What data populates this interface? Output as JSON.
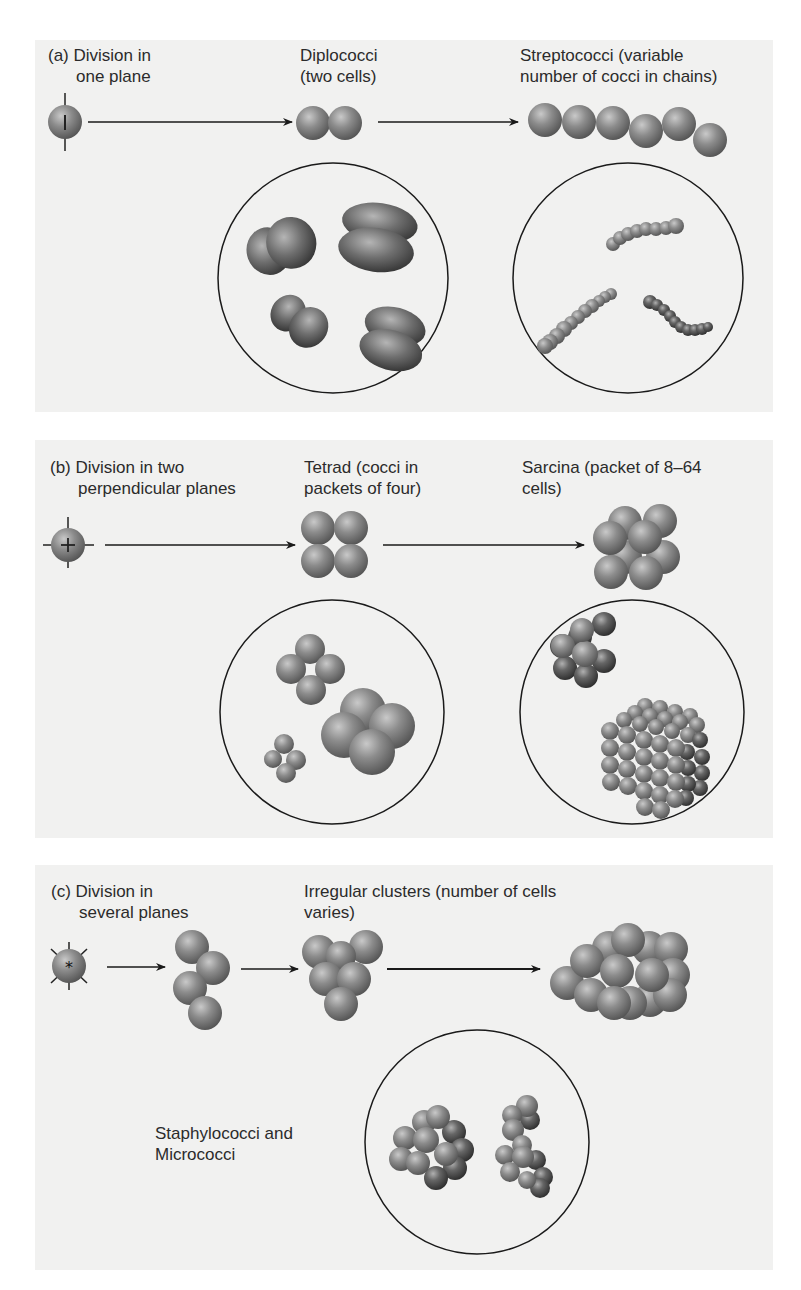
{
  "figure": {
    "panels": [
      {
        "id": "a",
        "heading_line1": "(a) Division in",
        "heading_line2": "one plane",
        "stages": [
          {
            "line1": "Diplococci",
            "line2": "(two cells)"
          },
          {
            "line1": "Streptococci (variable",
            "line2": "number of cocci in chains)"
          }
        ],
        "division_marker": "single vertical plane"
      },
      {
        "id": "b",
        "heading_line1": "(b) Division in two",
        "heading_line2": "perpendicular planes",
        "stages": [
          {
            "line1": "Tetrad (cocci in",
            "line2": "packets of four)"
          },
          {
            "line1": "Sarcina (packet of 8–64",
            "line2": "cells)"
          }
        ],
        "division_marker": "two perpendicular planes (+)"
      },
      {
        "id": "c",
        "heading_line1": "(c) Division in",
        "heading_line2": "several planes",
        "stages": [
          {
            "line1": "Irregular clusters (number of cells",
            "line2": "varies)"
          }
        ],
        "micrograph_caption_line1": "Staphylococci and",
        "micrograph_caption_line2": "Micrococci",
        "division_marker": "several planes (*)"
      }
    ],
    "colors": {
      "panel_bg": "#f1f1f0",
      "cell_base": "#8a8a8a",
      "cell_dark": "#4a4a4a",
      "line": "#1a1a1a"
    }
  }
}
